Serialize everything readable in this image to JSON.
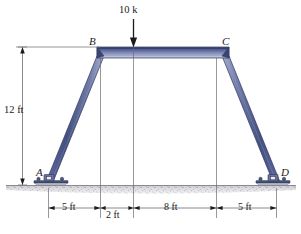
{
  "figure": {
    "type": "structural-frame-diagram",
    "joint_labels": [
      {
        "name": "A",
        "text": "A",
        "role": "pin-support-left"
      },
      {
        "name": "B",
        "text": "B",
        "role": "left-knee-joint"
      },
      {
        "name": "C",
        "text": "C",
        "role": "right-knee-joint"
      },
      {
        "name": "D",
        "text": "D",
        "role": "pin-support-right"
      }
    ],
    "load": {
      "label": "10 k",
      "magnitude": 10,
      "unit": "k",
      "direction": "down",
      "applied_to": "beam BC"
    },
    "vertical_dimension": {
      "label": "12 ft",
      "value": 12,
      "unit": "ft"
    },
    "horizontal_dimensions": [
      {
        "label": "5 ft",
        "value": 5,
        "unit": "ft"
      },
      {
        "label": "2 ft",
        "value": 2,
        "unit": "ft"
      },
      {
        "label": "8 ft",
        "value": 8,
        "unit": "ft"
      },
      {
        "label": "5 ft",
        "value": 5,
        "unit": "ft"
      }
    ],
    "colors": {
      "member_dark": "#4d5a86",
      "member_mid": "#6c79a8",
      "member_light": "#aab3cd",
      "member_edge": "#2b3357",
      "line": "#6c6c74",
      "arrow": "#1b1b1b",
      "ground_fill": "#d9d9dc",
      "ground_line": "#8a8a90",
      "support_body": "#3f4a74",
      "support_plate": "#4a5478",
      "text": "#1b1b1b"
    }
  }
}
